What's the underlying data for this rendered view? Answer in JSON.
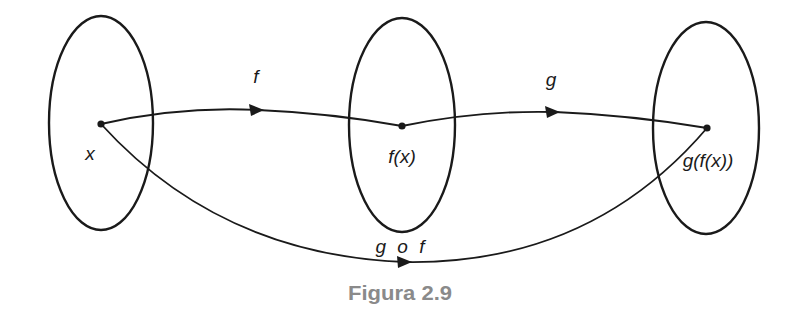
{
  "diagram": {
    "type": "function-composition",
    "sets": [
      {
        "id": "X",
        "element_label": "x"
      },
      {
        "id": "Y",
        "element_label": "f(x)"
      },
      {
        "id": "Z",
        "element_label": "g(f(x))"
      }
    ],
    "arrows": [
      {
        "from": "x",
        "to": "f(x)",
        "label": "f"
      },
      {
        "from": "f(x)",
        "to": "g(f(x))",
        "label": "g"
      },
      {
        "from": "x",
        "to": "g(f(x))",
        "label": "g o f"
      }
    ],
    "caption": "Figura 2.9"
  },
  "colors": {
    "stroke": "#1a1a1a",
    "caption": "#8a8a8a",
    "background": "#ffffff"
  }
}
